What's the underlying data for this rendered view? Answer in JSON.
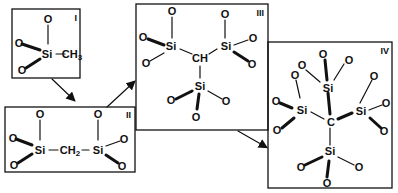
{
  "diagram": {
    "panels": [
      {
        "id": "I",
        "label": "I",
        "center_group": "Si",
        "substituent": "CH3"
      },
      {
        "id": "II",
        "label": "II",
        "bridge": "CH2",
        "groups": [
          "Si",
          "Si"
        ]
      },
      {
        "id": "III",
        "label": "III",
        "center_group": "CH",
        "groups": [
          "Si",
          "Si",
          "Si"
        ]
      },
      {
        "id": "IV",
        "label": "IV",
        "center_group": "C",
        "groups": [
          "Si",
          "Si",
          "Si",
          "Si"
        ]
      }
    ],
    "atoms": {
      "si": "Si",
      "o": "O",
      "c": "C",
      "ch": "CH",
      "ch_main": "CH",
      "h": "H",
      "sub2": "2",
      "sub3": "3"
    },
    "arrows": [
      {
        "from": "I",
        "to": "II"
      },
      {
        "from": "II",
        "to": "III"
      },
      {
        "from": "III",
        "to": "IV"
      }
    ]
  }
}
